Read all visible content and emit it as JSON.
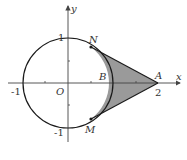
{
  "figure": {
    "type": "coordinate-geometry",
    "axes": {
      "x_label": "x",
      "y_label": "y",
      "origin_label": "O",
      "x_ticks": [
        "-1",
        "2"
      ],
      "y_ticks": [
        "1",
        "-1"
      ]
    },
    "points": {
      "A": {
        "label": "A",
        "coords": [
          2,
          0
        ]
      },
      "B": {
        "label": "B",
        "coords": [
          1,
          0
        ]
      },
      "N": {
        "label": "N",
        "coords": [
          0.5,
          0.866
        ]
      },
      "M": {
        "label": "M",
        "coords": [
          0.5,
          -0.866
        ]
      },
      "O": {
        "label": "O",
        "coords": [
          0,
          0
        ]
      }
    },
    "circle": {
      "center": [
        0,
        0
      ],
      "radius": 1
    },
    "shaded_region": "region bounded by tangent segments AN, AM and arc NBM",
    "colors": {
      "stroke": "#1a1a1a",
      "axis": "#444444",
      "shade": "#9a9a9a"
    }
  }
}
